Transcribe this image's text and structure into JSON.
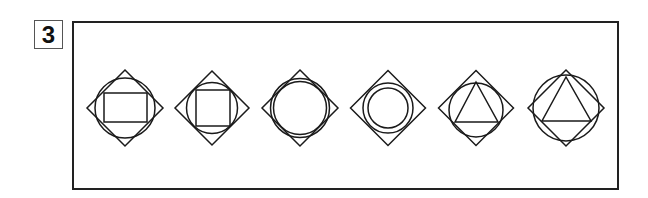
{
  "problem": {
    "number": "3",
    "stroke_color": "#1a1a1a",
    "figures": [
      {
        "id": 1,
        "description": "diamond, circle, rectangle",
        "cx": 125,
        "cy": 108,
        "diamond_half": 38,
        "circles": [
          {
            "r": 30
          }
        ],
        "rect": {
          "x": 104,
          "y": 93,
          "w": 43,
          "h": 29
        }
      },
      {
        "id": 2,
        "description": "diamond, circle, square",
        "cx": 212,
        "cy": 108,
        "diamond_half": 37,
        "circles": [
          {
            "r": 25.5
          }
        ],
        "rect": {
          "x": 196,
          "y": 90,
          "w": 34,
          "h": 36
        }
      },
      {
        "id": 3,
        "description": "diamond, two concentric circles (close)",
        "cx": 300,
        "cy": 108,
        "diamond_half": 38,
        "circles": [
          {
            "r": 29.5
          },
          {
            "r": 26.5
          }
        ]
      },
      {
        "id": 4,
        "description": "diamond, two concentric circles (spaced)",
        "cx": 388,
        "cy": 108,
        "diamond_half": 37.5,
        "circles": [
          {
            "r": 25
          },
          {
            "r": 20
          }
        ]
      },
      {
        "id": 5,
        "description": "diamond, circle, triangle",
        "cx": 476,
        "cy": 108,
        "diamond_half": 37.5,
        "circles": [
          {
            "r": 27,
            "cy": 110
          }
        ],
        "triangle": [
          [
            476,
            82
          ],
          [
            455,
            122
          ],
          [
            498,
            122
          ]
        ]
      },
      {
        "id": 6,
        "description": "diamond, larger circle, triangle",
        "cx": 566,
        "cy": 108,
        "diamond_half": 38,
        "circles": [
          {
            "r": 33
          }
        ],
        "triangle": [
          [
            566,
            77
          ],
          [
            542,
            121
          ],
          [
            591,
            121
          ]
        ]
      }
    ]
  }
}
